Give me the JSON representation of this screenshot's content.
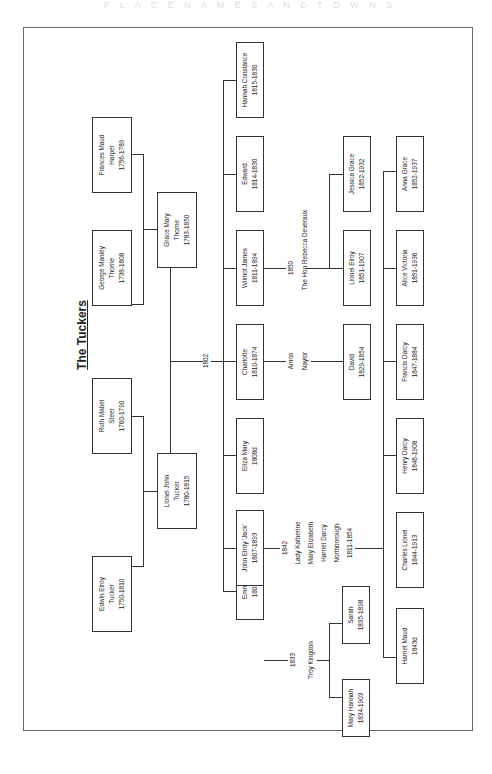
{
  "title": "The Tuckers",
  "header_fade": "P L A C E   N A M E S   A N D   T O W N S",
  "grandparents": [
    {
      "name": "Edwin Elroy",
      "line2": "Tucker",
      "dates": "1750-1810"
    },
    {
      "name": "Ruth Mabel",
      "line2": "Steer",
      "dates": "1760-1790"
    },
    {
      "name": "George Manley",
      "line2": "Thorne",
      "dates": "1738-1808"
    },
    {
      "name": "Frances Maud",
      "line2": "Harper",
      "dates": "1756-1789"
    }
  ],
  "parents": [
    {
      "name": "Lionel John",
      "line2": "Tucker",
      "dates": "1780-1815"
    },
    {
      "name": "Grace Mary",
      "line2": "Thorne",
      "dates": "1783-1850"
    }
  ],
  "marriage_year": "1802",
  "children": [
    {
      "name": "Emma Jane",
      "dates": "1803-1879"
    },
    {
      "name": "John Elroy 'Jack'",
      "dates": "1807-1893"
    },
    {
      "name": "Eliza Mary",
      "dates": "1808d"
    },
    {
      "name": "Charlotte",
      "dates": "1810-1874"
    },
    {
      "name": "Wilmot James",
      "dates": "1811-1894"
    },
    {
      "name": "Edward",
      "dates": "1814-1830"
    },
    {
      "name": "Hannah Constance",
      "dates": "1815-1830"
    }
  ],
  "spouses": {
    "emma": {
      "year": "1833",
      "name": "Troy Kingdon"
    },
    "jack": {
      "year": "1842",
      "lines": [
        "Lady Katherine",
        "Mary Elizabeth",
        "Harriet Darcy",
        "Northborough",
        "1811-1854"
      ]
    },
    "charlotte": {
      "lines": [
        "Amos",
        "Naylor"
      ]
    },
    "wilmot": {
      "year": "1850",
      "name": "The Hon Rebecca Deveraux"
    }
  },
  "grandchildren": {
    "emma": [
      {
        "name": "Mary Hannah",
        "dates": "1834-1903"
      },
      {
        "name": "Sarah",
        "dates": "1835-1898"
      }
    ],
    "jack": [
      {
        "name": "Harriet Maud",
        "dates": "1843d"
      },
      {
        "name": "Charles Lionel",
        "dates": "1844-1913"
      },
      {
        "name": "Henry Darcy",
        "dates": "1846-1908"
      },
      {
        "name": "Francis Darcy",
        "dates": "1847-1884"
      },
      {
        "name": "Alice Victoria",
        "dates": "1851-1936"
      },
      {
        "name": "Anna Grace",
        "dates": "1852-1937"
      }
    ],
    "charlotte": [
      {
        "name": "David",
        "dates": "1829-1854"
      }
    ],
    "wilmot": [
      {
        "name": "Lionel Elroy",
        "dates": "1851-1907"
      },
      {
        "name": "Jessica Grace",
        "dates": "1852-1932"
      }
    ]
  }
}
